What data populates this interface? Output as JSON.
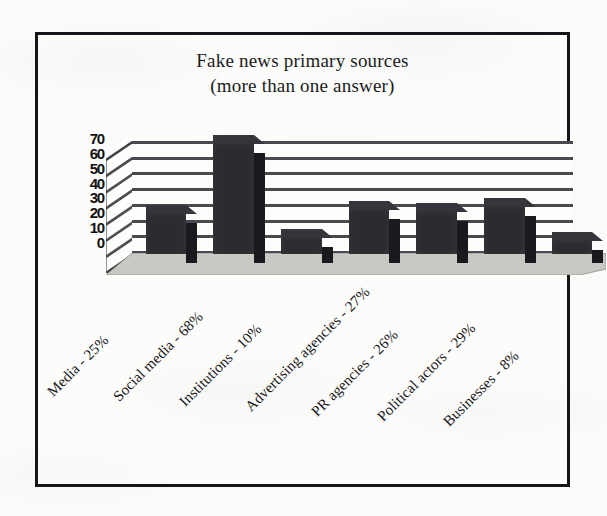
{
  "chart_data": {
    "type": "bar",
    "title": "Fake news primary sources",
    "subtitle": "(more than one answer)",
    "title_lines": [
      "Fake news primary sources",
      "(more than one answer)"
    ],
    "xlabel": "",
    "ylabel": "",
    "ylim": [
      0,
      70
    ],
    "yticks": [
      70,
      60,
      50,
      40,
      30,
      20,
      10,
      0
    ],
    "ytick_labels": [
      "70",
      "60",
      "50",
      "40",
      "30",
      "20",
      "10",
      "0"
    ],
    "grid": true,
    "grid_orientation": "horizontal",
    "legend": false,
    "legend_position": "none",
    "style": "3d-column",
    "bar_color": "#2b2b30",
    "categories": [
      "Media",
      "Social media",
      "Institutions",
      "Advertising agencies",
      "PR agencies",
      "Political actors",
      "Businesses"
    ],
    "values": [
      25,
      68,
      10,
      27,
      26,
      29,
      8
    ],
    "value_unit": "%",
    "tick_labels": [
      "Media - 25%",
      "Social media - 68%",
      "Institutions - 10%",
      "Advertising agencies - 27%",
      "PR agencies - 26%",
      "Political actors - 29%",
      "Businesses - 8%"
    ],
    "annotations": []
  },
  "colors": {
    "bar_front": "#2b2b30",
    "bar_top": "#35353b",
    "bar_side": "#191a1e",
    "grid_line": "#3a3a40",
    "frame": "#16161a",
    "floor": "#c9c9c4",
    "paper": "#fbfbf9",
    "text": "#17171a"
  }
}
